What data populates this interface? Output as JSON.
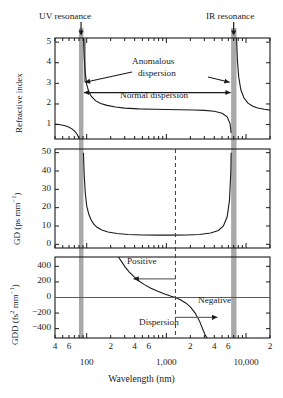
{
  "figure": {
    "resonances": {
      "uv_label": "UV resonance",
      "ir_label": "IR resonance",
      "band_color": "#a9a9a9",
      "uv_center_nm": 85,
      "ir_center_nm": 7000
    },
    "xaxis": {
      "title": "Wavelength (nm)",
      "scale": "log",
      "range_nm": [
        40,
        20000
      ],
      "minor_labels": [
        "4",
        "6",
        "2",
        "4",
        "6",
        "2",
        "4",
        "6",
        "2"
      ],
      "minor_label_values": [
        40,
        60,
        200,
        400,
        600,
        2000,
        4000,
        6000,
        20000
      ],
      "decade_labels": [
        "100",
        "1,000",
        "10,000"
      ],
      "decade_values": [
        100,
        1000,
        10000
      ]
    },
    "panels": [
      {
        "id": "refractive-index",
        "ylabel": "Refractive index",
        "yticks": [
          "1",
          "2",
          "3",
          "4",
          "5"
        ],
        "ytick_values": [
          1,
          2,
          3,
          4,
          5
        ],
        "ylim": [
          0.3,
          5.2
        ],
        "annotations": [
          {
            "id": "anomalous",
            "line1": "Anomalous",
            "line2": "dispersion"
          },
          {
            "id": "normal",
            "text": "Normal dispersion"
          }
        ]
      },
      {
        "id": "group-delay",
        "ylabel_html": "GD (ps mm<sup>−1</sup>)",
        "ylabel_plain": "GD (ps mm-1)",
        "yticks": [
          "0",
          "10",
          "20",
          "30",
          "40",
          "50"
        ],
        "ytick_values": [
          0,
          10,
          20,
          30,
          40,
          50
        ],
        "ylim": [
          -2,
          52
        ]
      },
      {
        "id": "group-delay-dispersion",
        "ylabel_html": "GDD (fs<sup>2</sup> mm<sup>−1</sup>)",
        "ylabel_plain": "GDD (fs2 mm-1)",
        "yticks": [
          "400",
          "200",
          "0",
          "−200",
          "−400"
        ],
        "ytick_values": [
          400,
          200,
          0,
          -200,
          -400
        ],
        "ylim": [
          -520,
          520
        ],
        "zero_crossing_nm": 1300,
        "annotations": [
          {
            "id": "positive",
            "text": "Positive"
          },
          {
            "id": "negative",
            "text": "Negative"
          },
          {
            "id": "dispersion",
            "text": "Dispersion"
          }
        ]
      }
    ]
  },
  "chart_data": {
    "type": "line",
    "title": "",
    "subtitle": "",
    "xlabel": "Wavelength (nm)",
    "xscale": "log",
    "xlim": [
      40,
      20000
    ],
    "xticks": [
      100,
      1000,
      10000
    ],
    "xticklabels": [
      "100",
      "1,000",
      "10,000"
    ],
    "xminor_ticklabels": [
      "4",
      "6",
      "2",
      "4",
      "6",
      "2",
      "4",
      "6",
      "2"
    ],
    "grid": false,
    "legend": "none",
    "annotations": [
      "UV resonance",
      "IR resonance",
      "Anomalous dispersion",
      "Normal dispersion",
      "Positive",
      "Negative",
      "Dispersion"
    ],
    "shaded_bands_nm": [
      [
        80,
        91
      ],
      [
        6500,
        7600
      ]
    ],
    "subplots": [
      {
        "name": "Refractive index",
        "ylabel": "Refractive index",
        "ylim": [
          0.3,
          5.2
        ],
        "yticks": [
          1,
          2,
          3,
          4,
          5
        ],
        "series": [
          {
            "name": "n, short-wavelength branch",
            "x": [
              40,
              45,
              50,
              55,
              60,
              66,
              72,
              77,
              80
            ],
            "y": [
              1.02,
              1.0,
              0.97,
              0.93,
              0.87,
              0.78,
              0.65,
              0.48,
              0.33
            ]
          },
          {
            "name": "n, transparent branch",
            "x": [
              91,
              93,
              96,
              100,
              106,
              115,
              130,
              150,
              180,
              230,
              300,
              450,
              700,
              1000,
              1500,
              2200,
              3000,
              4000,
              5000,
              5800,
              6300,
              6500
            ],
            "y": [
              5.2,
              4.3,
              3.5,
              2.95,
              2.6,
              2.35,
              2.15,
              2.02,
              1.93,
              1.85,
              1.8,
              1.76,
              1.74,
              1.73,
              1.72,
              1.71,
              1.69,
              1.65,
              1.55,
              1.38,
              1.05,
              0.6
            ]
          },
          {
            "name": "n, long-wavelength branch",
            "x": [
              7600,
              7800,
              8100,
              8600,
              9400,
              10500,
              12000,
              14000,
              17000,
              20000
            ],
            "y": [
              5.2,
              4.1,
              3.3,
              2.7,
              2.3,
              2.05,
              1.9,
              1.8,
              1.74,
              1.7
            ]
          }
        ]
      },
      {
        "name": "Group delay",
        "ylabel": "GD (ps mm-1)",
        "ylim": [
          -2,
          52
        ],
        "yticks": [
          0,
          10,
          20,
          30,
          40,
          50
        ],
        "series": [
          {
            "name": "GD",
            "x": [
              91,
              93,
              96,
              100,
              106,
              113,
              122,
              135,
              155,
              185,
              240,
              330,
              500,
              800,
              1200,
              1800,
              2600,
              3600,
              4500,
              5200,
              5800,
              6200,
              6450,
              6500
            ],
            "y": [
              50,
              38,
              28,
              21,
              16.5,
              13.5,
              11.2,
              9.3,
              7.8,
              6.7,
              5.9,
              5.4,
              5.1,
              5.0,
              5.0,
              5.1,
              5.4,
              6.2,
              7.6,
              10.0,
              15.0,
              24.0,
              40.0,
              50.0
            ]
          }
        ]
      },
      {
        "name": "Group delay dispersion",
        "ylabel": "GDD (fs2 mm-1)",
        "ylim": [
          -520,
          520
        ],
        "yticks": [
          -400,
          -200,
          0,
          200,
          400
        ],
        "series": [
          {
            "name": "GDD",
            "x": [
              250,
              270,
              300,
              340,
              390,
              450,
              530,
              640,
              780,
              950,
              1150,
              1300,
              1500,
              1750,
              2000,
              2300,
              2600,
              2900,
              3100,
              3250
            ],
            "y": [
              520,
              470,
              400,
              330,
              270,
              215,
              165,
              120,
              80,
              45,
              15,
              0,
              -30,
              -70,
              -120,
              -200,
              -300,
              -420,
              -490,
              -520
            ]
          }
        ],
        "zero_line": 0,
        "dashed_vline_nm": 1300
      }
    ]
  }
}
